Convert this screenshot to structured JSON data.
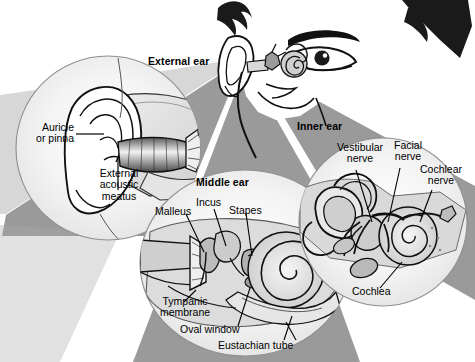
{
  "figure": {
    "background_color": "#ffffff",
    "wedge_color": "#9a9a9a",
    "wedge_color_light": "#b5b5b5",
    "inset_fill": "#ffffff",
    "inset_stroke": "#8f8f8f",
    "line_color": "#000000",
    "label_color": "#000000"
  },
  "sections": {
    "external": {
      "title": "External ear"
    },
    "middle": {
      "title": "Middle ear"
    },
    "inner": {
      "title": "Inner ear"
    }
  },
  "labels": {
    "external": [
      {
        "id": "auricle",
        "text": "Auricle\nor pinna"
      },
      {
        "id": "meatus",
        "text": "External\nacoustic\nmeatus"
      }
    ],
    "middle": [
      {
        "id": "malleus",
        "text": "Malleus"
      },
      {
        "id": "incus",
        "text": "Incus"
      },
      {
        "id": "stapes",
        "text": "Stapes"
      },
      {
        "id": "tympanic",
        "text": "Tympanic\nmembrane"
      },
      {
        "id": "oval",
        "text": "Oval window"
      },
      {
        "id": "eustachian",
        "text": "Eustachian tube"
      }
    ],
    "inner": [
      {
        "id": "vestibular",
        "text": "Vestibular\nnerve"
      },
      {
        "id": "facial",
        "text": "Facial\nnerve"
      },
      {
        "id": "cochlear",
        "text": "Cochlear\nnerve"
      },
      {
        "id": "cochlea",
        "text": "Cochlea"
      }
    ]
  },
  "head": {
    "description": "Side-front view of a human head with visible eye, eyebrow, hair, nose and ear",
    "parts": [
      "hair",
      "eyebrow",
      "eye",
      "nose",
      "ear",
      "inner-ear-structure"
    ]
  }
}
